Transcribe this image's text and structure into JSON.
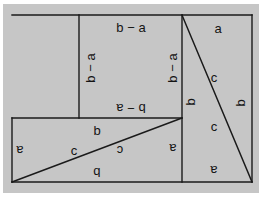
{
  "figure": {
    "colors": {
      "background": "#ffffff",
      "plate": "#c6c6c6",
      "stroke": "#1a1a1a"
    },
    "frame": {
      "x": 12,
      "y": 15,
      "width": 240,
      "height": 167
    },
    "lines": [
      {
        "name": "outer-frame-top",
        "x1": 12,
        "y1": 15,
        "x2": 252,
        "y2": 15
      },
      {
        "name": "outer-frame-right",
        "x1": 252,
        "y1": 15,
        "x2": 252,
        "y2": 182
      },
      {
        "name": "outer-frame-bottom",
        "x1": 252,
        "y1": 182,
        "x2": 12,
        "y2": 182
      },
      {
        "name": "outer-frame-left",
        "x1": 12,
        "y1": 182,
        "x2": 12,
        "y2": 118
      },
      {
        "name": "lower-rect-top",
        "x1": 12,
        "y1": 118,
        "x2": 182,
        "y2": 118
      },
      {
        "name": "upper-square-left",
        "x1": 79,
        "y1": 118,
        "x2": 79,
        "y2": 15
      },
      {
        "name": "mid-vertical",
        "x1": 182,
        "y1": 15,
        "x2": 182,
        "y2": 182
      },
      {
        "name": "hypotenuse-lower",
        "x1": 12,
        "y1": 182,
        "x2": 182,
        "y2": 118
      },
      {
        "name": "hypotenuse-right",
        "x1": 182,
        "y1": 15,
        "x2": 252,
        "y2": 182
      }
    ],
    "labels": [
      {
        "name": "label-top-b-minus-a",
        "text": "b − a",
        "x": 131,
        "y": 27,
        "rotation": 0
      },
      {
        "name": "label-upper-left-b-minus-a",
        "text": "b − a",
        "x": 90,
        "y": 68,
        "rotation": -90
      },
      {
        "name": "label-upper-right-b-minus-a",
        "text": "b − a",
        "x": 172,
        "y": 68,
        "rotation": -90
      },
      {
        "name": "label-upper-bottom-b-minus-a",
        "text": "b − a",
        "x": 131,
        "y": 108,
        "rotation": 180
      },
      {
        "name": "label-right-top-a",
        "text": "a",
        "x": 218,
        "y": 28,
        "rotation": 0
      },
      {
        "name": "label-right-c-upper",
        "text": "c",
        "x": 214,
        "y": 77,
        "rotation": 0
      },
      {
        "name": "label-right-c-lower",
        "text": "c",
        "x": 214,
        "y": 126,
        "rotation": 0
      },
      {
        "name": "label-far-right-b",
        "text": "b",
        "x": 240,
        "y": 103,
        "rotation": -90
      },
      {
        "name": "label-mid-b",
        "text": "b",
        "x": 190,
        "y": 102,
        "rotation": -90
      },
      {
        "name": "label-right-bottom-a",
        "text": "a",
        "x": 214,
        "y": 170,
        "rotation": 180
      },
      {
        "name": "label-lower-inner-a",
        "text": "a",
        "x": 173,
        "y": 148,
        "rotation": 180
      },
      {
        "name": "label-lower-top-b",
        "text": "b",
        "x": 97,
        "y": 130,
        "rotation": 0
      },
      {
        "name": "label-lower-left-a",
        "text": "a",
        "x": 20,
        "y": 150,
        "rotation": 180
      },
      {
        "name": "label-lower-c-left",
        "text": "c",
        "x": 74,
        "y": 150,
        "rotation": 0
      },
      {
        "name": "label-lower-c-right",
        "text": "c",
        "x": 120,
        "y": 150,
        "rotation": 180
      },
      {
        "name": "label-lower-bottom-b",
        "text": "b",
        "x": 97,
        "y": 172,
        "rotation": 180
      }
    ]
  }
}
